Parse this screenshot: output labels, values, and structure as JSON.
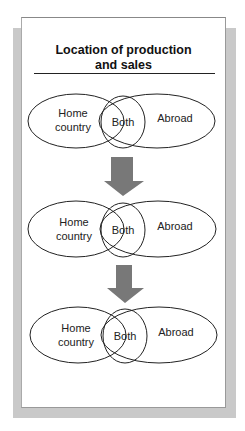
{
  "title_line1": "Location of production",
  "title_line2": "and sales",
  "colors": {
    "arrow": "#787878",
    "stroke": "#222222",
    "shadow": "#c9c9c9"
  },
  "stages": [
    {
      "home_line1": "Home",
      "home_line2": "country",
      "both": "Both",
      "abroad": "Abroad"
    },
    {
      "home_line1": "Home",
      "home_line2": "country",
      "both": "Both",
      "abroad": "Abroad"
    },
    {
      "home_line1": "Home",
      "home_line2": "country",
      "both": "Both",
      "abroad": "Abroad"
    }
  ],
  "arrows": [
    "down-arrow",
    "down-arrow"
  ]
}
